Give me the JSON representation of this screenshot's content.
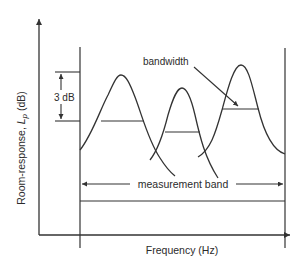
{
  "diagram": {
    "y_axis_label": "Room-response, ",
    "y_axis_symbol": "L",
    "y_axis_subscript": "p",
    "y_axis_unit": " (dB)",
    "x_axis_label": "Frequency (Hz)",
    "dB_range_label": "3 dB",
    "bandwidth_label": "bandwidth",
    "measurement_band_label": "measurement band",
    "colors": {
      "line": "#333333",
      "text": "#2b2b2b",
      "background": "#ffffff"
    },
    "peaks": [
      {
        "name": "peak-1",
        "apex_x": 121,
        "apex_y": 75,
        "half_power_y": 121,
        "bw_x1": 101,
        "bw_x2": 144
      },
      {
        "name": "peak-2",
        "apex_x": 182,
        "apex_y": 88,
        "half_power_y": 132,
        "bw_x1": 165,
        "bw_x2": 200
      },
      {
        "name": "peak-3",
        "apex_x": 241,
        "apex_y": 65,
        "half_power_y": 109,
        "bw_x1": 222,
        "bw_x2": 259
      }
    ]
  }
}
